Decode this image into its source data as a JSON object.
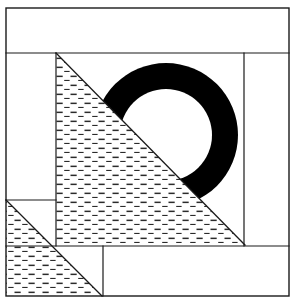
{
  "figure": {
    "canvas": {
      "width": 295,
      "height": 304,
      "background": "#ffffff"
    },
    "colors": {
      "background": "#ffffff",
      "stroke": "#1a1a1a",
      "fill_black": "#000000",
      "hatch_line": "#2b2b2b",
      "hatch_background": "#ffffff"
    },
    "frame": {
      "label": "outer-border-rectangle",
      "x": 6,
      "y": 8,
      "width": 283,
      "height": 288,
      "stroke_width": 1.4
    },
    "lines": [
      {
        "name": "top-band-divider",
        "x1": 6,
        "y1": 53,
        "x2": 289,
        "y2": 53,
        "stroke_width": 1.2
      },
      {
        "name": "left-column-divider",
        "x1": 56,
        "y1": 53,
        "x2": 56,
        "y2": 246,
        "stroke_width": 1.2
      },
      {
        "name": "right-column-divider",
        "x1": 244,
        "y1": 53,
        "x2": 244,
        "y2": 246,
        "stroke_width": 1.2
      },
      {
        "name": "bottom-band-divider",
        "x1": 6,
        "y1": 246,
        "x2": 289,
        "y2": 246,
        "stroke_width": 1.2
      },
      {
        "name": "lower-left-shelf-divider",
        "x1": 6,
        "y1": 200,
        "x2": 56,
        "y2": 200,
        "stroke_width": 1.2
      },
      {
        "name": "bottom-notch-divider",
        "x1": 103,
        "y1": 246,
        "x2": 103,
        "y2": 296,
        "stroke_width": 1.2
      },
      {
        "name": "main-diagonal",
        "x1": 56,
        "y1": 53,
        "x2": 245,
        "y2": 245,
        "stroke_width": 1.3
      },
      {
        "name": "secondary-diagonal",
        "x1": 6,
        "y1": 200,
        "x2": 102,
        "y2": 296,
        "stroke_width": 1.3
      }
    ],
    "shapes": [
      {
        "name": "hatched-upper-triangle",
        "kind": "polygon",
        "fill": "hatch",
        "points": "56,53 244,244 56,244"
      },
      {
        "name": "hatched-lower-left-triangle",
        "kind": "polygon",
        "fill": "hatch",
        "points": "6,200 102,296 6,296"
      },
      {
        "name": "black-ring-arc",
        "kind": "annulus-arc",
        "fill": "#000000",
        "center_x": 166,
        "center_y": 135,
        "outer_radius": 72,
        "inner_radius": 46,
        "start_angle_deg": 225,
        "end_angle_deg": 45,
        "description": "thick black crescent ring open toward lower-left, clipped by the main diagonal"
      }
    ],
    "regions": [
      {
        "name": "top-white-band",
        "fill": "white"
      },
      {
        "name": "left-white-column",
        "fill": "white"
      },
      {
        "name": "right-white-column",
        "fill": "white"
      },
      {
        "name": "bottom-white-band",
        "fill": "white"
      },
      {
        "name": "ring-interior-white-disc",
        "fill": "white"
      }
    ]
  }
}
